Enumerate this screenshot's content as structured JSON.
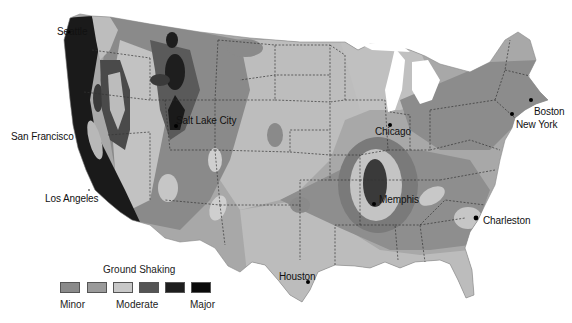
{
  "map": {
    "subject": "Contiguous United States seismic hazard (ground shaking) map",
    "cities": [
      {
        "name": "Seattle",
        "label": "Seattle",
        "x": 57,
        "y": 32
      },
      {
        "name": "San Francisco",
        "label": "San Francisco",
        "x": 78,
        "y": 138
      },
      {
        "name": "Los Angeles",
        "label": "Los Angeles",
        "x": 99,
        "y": 198
      },
      {
        "name": "Salt Lake City",
        "label": "Salt Lake City",
        "x": 173,
        "y": 125
      },
      {
        "name": "Chicago",
        "label": "Chicago",
        "x": 390,
        "y": 124
      },
      {
        "name": "Memphis",
        "label": "Memphis",
        "x": 374,
        "y": 204
      },
      {
        "name": "Charleston",
        "label": "Charleston",
        "x": 476,
        "y": 217
      },
      {
        "name": "Houston",
        "label": "Houston",
        "x": 308,
        "y": 282
      },
      {
        "name": "Boston",
        "label": "Boston",
        "x": 531,
        "y": 98
      },
      {
        "name": "New York",
        "label": "New York",
        "x": 512,
        "y": 113
      }
    ]
  },
  "legend": {
    "title": "Ground Shaking",
    "levels": [
      {
        "level": 1,
        "color": "#8a8a8a"
      },
      {
        "level": 2,
        "color": "#9a9a9a"
      },
      {
        "level": 3,
        "color": "#c8c8c8"
      },
      {
        "level": 4,
        "color": "#555555"
      },
      {
        "level": 5,
        "color": "#1e1e1e"
      },
      {
        "level": 6,
        "color": "#0a0a0a"
      }
    ],
    "labels": {
      "minor": "Minor",
      "moderate": "Moderate",
      "major": "Major"
    }
  },
  "colors": {
    "background": "#ffffff",
    "land_light": "#bdbdbd",
    "land_mid": "#9c9c9c",
    "land_dark": "#7d7d7d",
    "high": "#4a4a4a",
    "very_high": "#1a1a1a",
    "state_border": "#333333"
  }
}
